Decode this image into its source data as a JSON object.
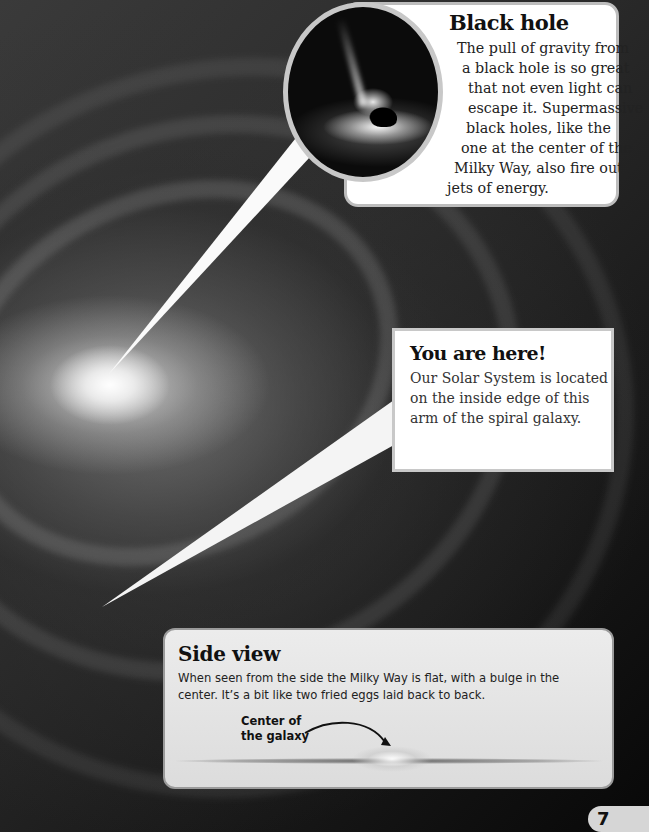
{
  "page": {
    "number": "7",
    "background_image": "spiral-galaxy-milky-way"
  },
  "callouts": {
    "black_hole": {
      "title": "Black hole",
      "lines": [
        "The pull of gravity from",
        "a black hole is so great",
        "that not even light can",
        "escape it. Supermassive",
        "black holes, like the",
        "one at the center of the",
        "Milky Way, also fire out",
        "jets of energy."
      ],
      "image": "black-hole-illustration"
    },
    "you_are_here": {
      "title": "You are here!",
      "text": "Our Solar System is located on the inside edge of this arm of the spiral galaxy."
    },
    "side_view": {
      "title": "Side view",
      "text": "When seen from the side the Milky Way is flat, with a bulge in the center. It’s a bit like two fried eggs laid back to back.",
      "label_line1": "Center of",
      "label_line2": "the galaxy"
    }
  },
  "colors": {
    "callout_bg": "#ffffff",
    "callout_border": "#c8c8c8",
    "side_box_bg": "#e4e4e4",
    "page_tab_bg": "#d6d6d6",
    "space_dark": "#0a0a0a"
  }
}
